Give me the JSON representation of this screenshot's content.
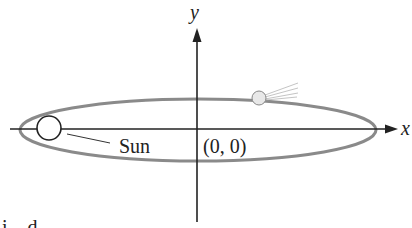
{
  "diagram": {
    "x_axis_label": "x",
    "y_axis_label": "y",
    "sun_label": "Sun",
    "origin_label": "(0, 0)",
    "cutoff_text": "i    d",
    "colors": {
      "orbit": "#8a8a8a",
      "axes": "#222222",
      "comet_fill": "#e6e6e6"
    }
  }
}
